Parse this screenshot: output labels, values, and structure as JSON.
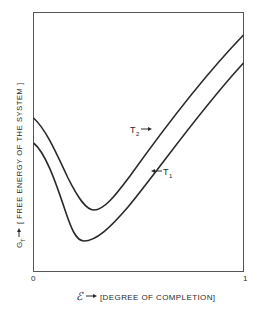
{
  "diagram": {
    "y_axis_label": {
      "symbol": "G",
      "subscript": "T",
      "text": "[ FREE ENERGY OF THE SYSTEM ]"
    },
    "x_axis_label": {
      "symbol": "ℰ",
      "text": "[DEGREE OF COMPLETION]"
    },
    "x_ticks": [
      "0",
      "1"
    ],
    "curves": [
      {
        "name": "T2",
        "label": "T",
        "subscript": "2",
        "position": "upper"
      },
      {
        "name": "T1",
        "label": "T",
        "subscript": "1",
        "position": "lower"
      }
    ],
    "colors": {
      "line": "#2a2a2a",
      "background": "#ffffff"
    }
  }
}
